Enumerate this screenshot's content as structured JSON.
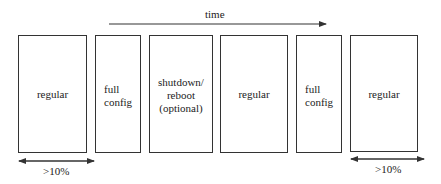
{
  "timeline": {
    "label": "time"
  },
  "boxes": [
    {
      "label": "regular"
    },
    {
      "label_line1": "full",
      "label_line2": "config"
    },
    {
      "label_line1": "shutdown/",
      "label_line2": "reboot",
      "label_line3": "(optional)"
    },
    {
      "label": "regular"
    },
    {
      "label_line1": "full",
      "label_line2": "config"
    },
    {
      "label": "regular"
    }
  ],
  "spans": [
    {
      "label": ">10%"
    },
    {
      "label": ">10%"
    }
  ],
  "colors": {
    "line": "#333333",
    "text": "#222222",
    "background": "#ffffff"
  }
}
